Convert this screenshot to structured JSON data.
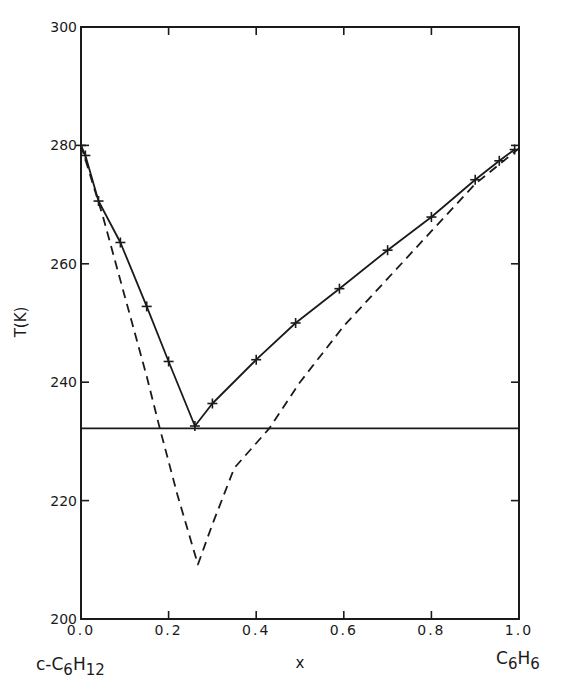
{
  "chart_data": {
    "type": "line",
    "title": "",
    "xlabel": "x",
    "ylabel": "T(K)",
    "xlim": [
      0.0,
      1.0
    ],
    "ylim": [
      200,
      300
    ],
    "grid": false,
    "legend": null,
    "x_ticks": [
      "0.0",
      "0.2",
      "0.4",
      "0.6",
      "0.8",
      "1.0"
    ],
    "y_ticks": [
      "200",
      "220",
      "240",
      "260",
      "280",
      "300"
    ],
    "x_end_labels": {
      "left": {
        "base": "c-C",
        "sub1": "6",
        "mid": "H",
        "sub2": "12"
      },
      "right": {
        "base": "C",
        "sub1": "6",
        "mid": "H",
        "sub2": "6"
      }
    },
    "series": [
      {
        "name": "experimental liquidus",
        "style": "solid",
        "marker": "plus",
        "points": [
          [
            0.0,
            280.0
          ],
          [
            0.01,
            278.3
          ],
          [
            0.04,
            270.6
          ],
          [
            0.09,
            263.6
          ],
          [
            0.15,
            252.8
          ],
          [
            0.2,
            243.5
          ],
          [
            0.26,
            232.6
          ],
          [
            0.3,
            236.4
          ],
          [
            0.4,
            243.8
          ],
          [
            0.49,
            250.0
          ],
          [
            0.59,
            255.8
          ],
          [
            0.7,
            262.3
          ],
          [
            0.8,
            267.9
          ],
          [
            0.9,
            274.2
          ],
          [
            0.955,
            277.4
          ],
          [
            0.99,
            279.3
          ]
        ]
      },
      {
        "name": "ideal solution liquidus",
        "style": "dashed",
        "marker": "none",
        "points": [
          [
            0.0,
            280.0
          ],
          [
            0.05,
            268.0
          ],
          [
            0.1,
            254.5
          ],
          [
            0.15,
            241.0
          ],
          [
            0.18,
            232.2
          ],
          [
            0.22,
            221.0
          ],
          [
            0.267,
            209.2
          ],
          [
            0.3,
            216.0
          ],
          [
            0.35,
            225.5
          ],
          [
            0.43,
            232.2
          ],
          [
            0.5,
            240.0
          ],
          [
            0.6,
            249.5
          ],
          [
            0.7,
            257.5
          ],
          [
            0.8,
            265.5
          ],
          [
            0.9,
            273.5
          ],
          [
            1.0,
            279.5
          ]
        ]
      },
      {
        "name": "eutectic temperature",
        "style": "solid",
        "marker": "none",
        "points": [
          [
            0.0,
            232.2
          ],
          [
            1.0,
            232.2
          ]
        ]
      }
    ]
  }
}
